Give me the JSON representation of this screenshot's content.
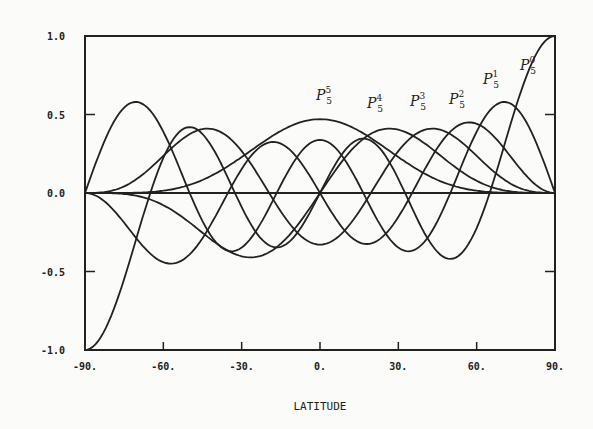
{
  "chart_data": {
    "type": "line",
    "title": "",
    "xlabel": "LATITUDE",
    "ylabel": "",
    "xlim": [
      -90,
      90
    ],
    "ylim": [
      -1.0,
      1.0
    ],
    "grid": false,
    "legend_position": "inline labels near curves",
    "x_ticks": [
      -90,
      -60,
      -30,
      0,
      30,
      60,
      90
    ],
    "x_tick_labels": [
      "-90.",
      "-60.",
      "-30.",
      "0.",
      "30.",
      "60.",
      "90."
    ],
    "y_ticks": [
      -1.0,
      -0.5,
      0.0,
      0.5,
      1.0
    ],
    "y_tick_labels": [
      "-1.0",
      "-0.5",
      "0.0",
      "0.5",
      "1.0"
    ],
    "series": [
      {
        "name": "P5^0",
        "label_base": "P",
        "label_sub": "5",
        "label_sup": "0",
        "order": 0,
        "peak": {
          "x": 90,
          "y": 1.0
        },
        "label_pos": {
          "x": 520,
          "y": 70
        }
      },
      {
        "name": "P5^1",
        "label_base": "P",
        "label_sub": "5",
        "label_sup": "1",
        "order": 1,
        "peak": {
          "x": 70,
          "y": 0.58
        },
        "label_pos": {
          "x": 483,
          "y": 84
        }
      },
      {
        "name": "P5^2",
        "label_base": "P",
        "label_sub": "5",
        "label_sup": "2",
        "order": 2,
        "peak": {
          "x": 50,
          "y": 0.45
        },
        "label_pos": {
          "x": 449,
          "y": 104
        }
      },
      {
        "name": "P5^3",
        "label_base": "P",
        "label_sub": "5",
        "label_sup": "3",
        "order": 3,
        "peak": {
          "x": 38,
          "y": 0.41
        },
        "label_pos": {
          "x": 410,
          "y": 106
        }
      },
      {
        "name": "P5^4",
        "label_base": "P",
        "label_sub": "5",
        "label_sup": "4",
        "order": 4,
        "peak": {
          "x": 25,
          "y": 0.41
        },
        "label_pos": {
          "x": 367,
          "y": 108
        }
      },
      {
        "name": "P5^5",
        "label_base": "P",
        "label_sub": "5",
        "label_sup": "5",
        "order": 5,
        "peak": {
          "x": 0,
          "y": 0.47
        },
        "label_pos": {
          "x": 316,
          "y": 100
        }
      }
    ]
  },
  "plot_area": {
    "left": 85,
    "right": 555,
    "top": 36,
    "bottom": 350
  },
  "colors": {
    "line": "#222222",
    "background": "#fbfbfa"
  }
}
